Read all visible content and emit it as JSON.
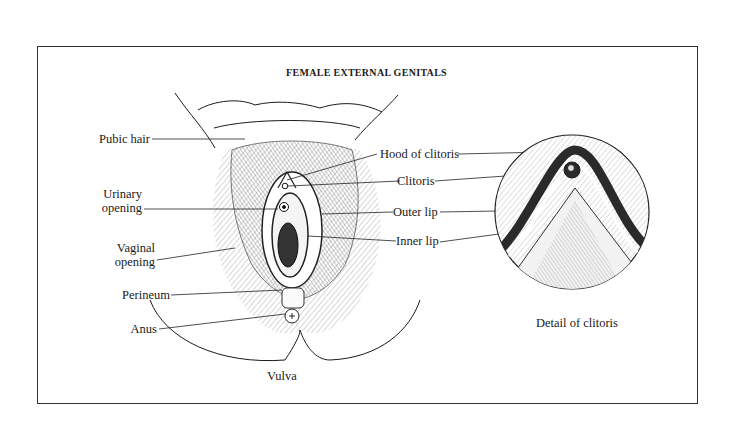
{
  "figure": {
    "title": "FEMALE EXTERNAL GENITALS",
    "main_caption": "Vulva",
    "detail_caption": "Detail of clitoris"
  },
  "labels_left": [
    {
      "id": "pubic-hair",
      "text": "Pubic hair"
    },
    {
      "id": "urinary-opening",
      "line1": "Urinary",
      "line2": "opening"
    },
    {
      "id": "vaginal-opening",
      "line1": "Vaginal",
      "line2": "opening"
    },
    {
      "id": "perineum",
      "text": "Perineum"
    },
    {
      "id": "anus",
      "text": "Anus"
    }
  ],
  "labels_right": [
    {
      "id": "hood-of-clitoris",
      "text": "Hood of clitoris"
    },
    {
      "id": "clitoris",
      "text": "Clitoris"
    },
    {
      "id": "outer-lip",
      "text": "Outer lip"
    },
    {
      "id": "inner-lip",
      "text": "Inner lip"
    }
  ],
  "colors": {
    "ink": "#1a1a1a",
    "frame": "#333333",
    "hatch": "#9a9a9a",
    "background": "#ffffff"
  }
}
